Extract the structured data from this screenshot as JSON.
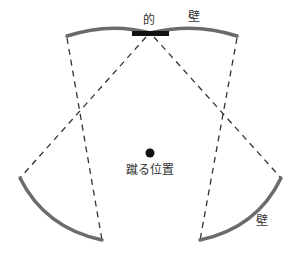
{
  "diagram": {
    "labels": {
      "target": "的",
      "wall_top": "壁",
      "kick_position": "蹴る位置",
      "wall_bottom": "壁"
    },
    "colors": {
      "wall": "#6b6b6b",
      "target": "#111111",
      "dashed": "#333333",
      "ball": "#111111",
      "text": "#333333"
    },
    "elements": [
      {
        "type": "wall",
        "position": "top",
        "shape": "double-arc"
      },
      {
        "type": "target",
        "position": "top-center",
        "shape": "rectangle"
      },
      {
        "type": "wall",
        "position": "bottom-left",
        "shape": "arc"
      },
      {
        "type": "wall",
        "position": "bottom-right",
        "shape": "arc"
      },
      {
        "type": "kick-point",
        "position": "center",
        "shape": "dot"
      },
      {
        "type": "sight-line",
        "count": 4,
        "style": "dashed"
      }
    ]
  }
}
